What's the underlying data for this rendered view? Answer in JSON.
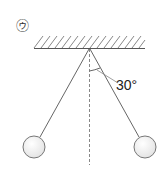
{
  "figure": {
    "label": "㋒",
    "angle_label": "30°",
    "angle_degrees": 30,
    "colors": {
      "line": "#555555",
      "hatch": "#888888",
      "ball_fill": "#f2f2f2",
      "ball_stroke": "#777777"
    }
  }
}
